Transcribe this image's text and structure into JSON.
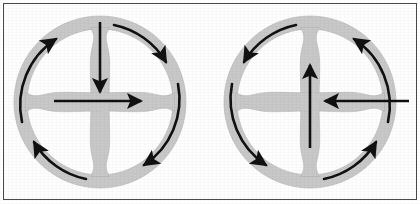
{
  "figure": {
    "background_color": "#ffffff",
    "frame_color": "#4a4a4a",
    "wheel_fill_color": "#c8c8c8",
    "wheel_edge_color": "#b3b3b3",
    "arrow_color": "#111111",
    "canvas_width": 420,
    "canvas_height": 204
  },
  "wheels": [
    {
      "id": "left-wheel",
      "label": "Left wheel",
      "center_x": 100,
      "center_y": 102,
      "outer_radius": 86,
      "rim_thickness": 13,
      "spoke_count": 4,
      "rotation_sense": "clockwise",
      "straight_arrows": [
        {
          "name": "vertical-arrow",
          "direction": "down",
          "from_x": 100,
          "from_y": 22,
          "to_x": 100,
          "to_y": 95
        },
        {
          "name": "horizontal-arrow",
          "direction": "right",
          "from_x": 54,
          "from_y": 101,
          "to_x": 143,
          "to_y": 101
        }
      ],
      "curved_arrows": [
        {
          "name": "curved-arrow-top-left",
          "quadrant": "top-left",
          "points_to": "up-right"
        },
        {
          "name": "curved-arrow-top-right",
          "quadrant": "top-right",
          "points_to": "down-right"
        },
        {
          "name": "curved-arrow-bottom-right",
          "quadrant": "bottom-right",
          "points_to": "down-left"
        },
        {
          "name": "curved-arrow-bottom-left",
          "quadrant": "bottom-left",
          "points_to": "up-left"
        }
      ]
    },
    {
      "id": "right-wheel",
      "label": "Right wheel",
      "center_x": 310,
      "center_y": 102,
      "outer_radius": 86,
      "rim_thickness": 13,
      "spoke_count": 4,
      "rotation_sense": "counter-clockwise",
      "straight_arrows": [
        {
          "name": "vertical-arrow",
          "direction": "up",
          "from_x": 310,
          "from_y": 148,
          "to_x": 310,
          "to_y": 58
        },
        {
          "name": "horizontal-arrow",
          "direction": "left",
          "from_x": 409,
          "from_y": 101,
          "to_x": 331,
          "to_y": 101
        }
      ],
      "curved_arrows": [
        {
          "name": "curved-arrow-top-right",
          "quadrant": "top-right",
          "points_to": "up-left"
        },
        {
          "name": "curved-arrow-top-left",
          "quadrant": "top-left",
          "points_to": "down-left"
        },
        {
          "name": "curved-arrow-bottom-left",
          "quadrant": "bottom-left",
          "points_to": "down-right"
        },
        {
          "name": "curved-arrow-bottom-right",
          "quadrant": "bottom-right",
          "points_to": "up-right"
        }
      ]
    }
  ]
}
